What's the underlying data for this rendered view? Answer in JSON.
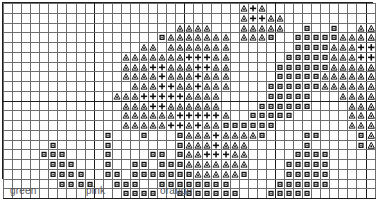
{
  "chart_data": {
    "type": "table",
    "title": "",
    "grid": {
      "columns": 41,
      "rows": 20,
      "cell_px": 9
    },
    "symbols": [
      {
        "key": "dot",
        "glyph": "●",
        "name": "filled-square-dot",
        "color_label": "green"
      },
      {
        "key": "triangle",
        "glyph": "△",
        "name": "triangle-outline",
        "color_label": "pink"
      },
      {
        "key": "plus",
        "glyph": "+",
        "name": "plus-sign",
        "color_label": "orange"
      }
    ],
    "legend": {
      "entries": [
        {
          "symbol": "dot",
          "label": "green"
        },
        {
          "symbol": "triangle",
          "label": "pink"
        },
        {
          "symbol": "plus",
          "label": "orange"
        }
      ]
    },
    "cells": [
      "...........................t.t...........",
      "..........................ttp.t..........",
      "..........................ttttt......................",
      "..................d.d.....tttd...........",
      "...................d.d...................",
      "...................d.....................",
      "..............d.......d....d.............",
      "..........dddd.....dddd..................",
      "........dddddddd...dddd.d................",
      "......ddd..dddd..d.dddddd................",
      "...................d.d...d...............",
      "...................d.....d...............",
      "..........d...............d..............",
      "............ddd...d..ddd.................",
      "...........ddddd..d..ddddd...............",
      "...........ddddd..d.....d................",
      "..............d...d..ddd.................",
      "...........dddddddddddddd................",
      ".............ddd.ddddddddd...............",
      "................ddddddd.................."
    ],
    "rows_full": [
      {
        "r": 0,
        "runs": [
          {
            "c": 26,
            "s": "t"
          },
          {
            "c": 27,
            "s": "p"
          },
          {
            "c": 28,
            "s": "t"
          }
        ]
      },
      {
        "r": 1,
        "runs": [
          {
            "c": 26,
            "s": "t"
          },
          {
            "c": 27,
            "s": "p"
          },
          {
            "c": 28,
            "s": "p"
          },
          {
            "c": 29,
            "s": "t"
          },
          {
            "c": 30,
            "s": "t"
          }
        ]
      },
      {
        "r": 2,
        "runs": [
          {
            "c": 26,
            "s": "t"
          },
          {
            "c": 27,
            "s": "t"
          },
          {
            "c": 28,
            "s": "t"
          },
          {
            "c": 29,
            "s": "t"
          },
          {
            "c": 30,
            "s": "t"
          }
        ]
      }
    ],
    "xlabel": "",
    "ylabel": "",
    "grid_on": true,
    "legend_position": "bottom-left"
  },
  "stitch_rows": [
    "..........................t.t............................",
    ".........................tppt t..........................",
    "........................ttttt............................"
  ]
}
